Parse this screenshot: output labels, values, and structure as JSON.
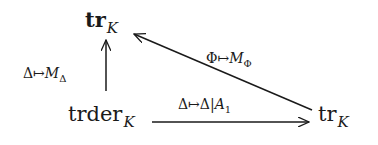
{
  "diagram": {
    "type": "commutative-diagram",
    "nodes": {
      "top": {
        "base": "tr",
        "sub": "K"
      },
      "bottom_left": {
        "base": "trder",
        "sub": "K"
      },
      "bottom_right": {
        "base": "tr",
        "sub": "K"
      }
    },
    "arrows": {
      "vertical": {
        "from": "bottom_left",
        "to": "top",
        "label_pre": "Δ↦",
        "label_var": "M",
        "label_sub": "Δ"
      },
      "horizontal": {
        "from": "bottom_left",
        "to": "bottom_right",
        "label_pre": "Δ↦Δ|",
        "label_var": "A",
        "label_sub": "1"
      },
      "diagonal": {
        "from": "bottom_right",
        "to": "top",
        "label_pre": "Φ↦",
        "label_var": "M",
        "label_sub": "Φ"
      }
    },
    "colors": {
      "ink": "#1a1a1a",
      "background": "#ffffff"
    }
  }
}
